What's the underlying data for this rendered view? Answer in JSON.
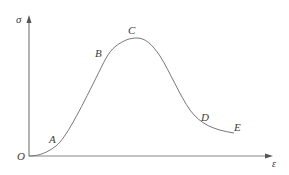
{
  "diagram": {
    "type": "stress-strain curve",
    "axes": {
      "y_label": "σ",
      "x_label": "ε",
      "origin_label": "O"
    },
    "points": [
      {
        "label": "A",
        "x": 52,
        "y": 136
      },
      {
        "label": "B",
        "x": 96,
        "y": 50
      },
      {
        "label": "C",
        "x": 128,
        "y": 28
      },
      {
        "label": "D",
        "x": 201,
        "y": 114
      },
      {
        "label": "E",
        "x": 234,
        "y": 123
      }
    ],
    "colors": {
      "axis": "#555555",
      "curve": "#777777",
      "text": "#3a3a3a",
      "background": "#ffffff"
    }
  }
}
